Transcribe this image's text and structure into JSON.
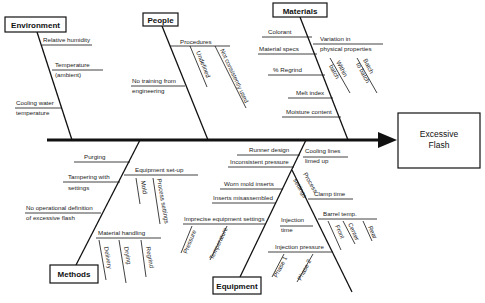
{
  "effect": {
    "line1": "Excessive",
    "line2": "Flash"
  },
  "categories": {
    "environment": "Environment",
    "people": "People",
    "materials": "Materials",
    "methods": "Methods",
    "equipment": "Equipment"
  },
  "environment": {
    "relative_humidity": "Relative humidity",
    "temperature_1": "Temperature",
    "temperature_2": "(ambient)",
    "cooling_1": "Cooling water",
    "cooling_2": "temperature"
  },
  "people": {
    "procedures": "Procedures",
    "undefined": "Undefined",
    "not_consistently_used": "Not consistently used",
    "no_training_1": "No training from",
    "no_training_2": "engineering"
  },
  "materials": {
    "colorant": "Colorant",
    "material_specs": "Material specs",
    "variation_1": "Variation in",
    "variation_2": "physical properties",
    "within_batch_1": "Within",
    "within_batch_2": "batch",
    "batch_to_batch_1": "Batch",
    "batch_to_batch_2": "to batch",
    "regrind": "% Regrind",
    "melt_index": "Melt index",
    "moisture": "Moisture content"
  },
  "methods": {
    "purging": "Purging",
    "tampering_1": "Tampering with",
    "tampering_2": "settings",
    "equipment_setup": "Equipment set-up",
    "mold": "Mold",
    "process_settings": "Process settings",
    "no_def_1": "No operational definition",
    "no_def_2": "of excessive flash",
    "material_handling": "Material handling",
    "delivery": "Delivery",
    "drying": "Drying",
    "regrind": "Regrind"
  },
  "equipment": {
    "runner_design": "Runner design",
    "inconsistent_pressure": "Inconsistent pressure",
    "worn_mold_inserts": "Worn mold inserts",
    "inserts_misassembled": "Inserts misassembled",
    "imprecise_settings": "Imprecise equipment settings",
    "pressure": "Pressure",
    "temperature": "Temperature",
    "cooling_lines_1": "Cooling lines",
    "cooling_lines_2": "limed up",
    "process_settings_1": "Process",
    "process_settings_2": "settings",
    "clamp_time": "Clamp time",
    "barrel_temp": "Barrel temp.",
    "front": "Front",
    "center": "Center",
    "rear": "Rear",
    "injection_time_1": "Injection",
    "injection_time_2": "time",
    "injection_pressure": "Injection pressure",
    "phase1": "Phase 1",
    "phase2": "Phase 2"
  }
}
